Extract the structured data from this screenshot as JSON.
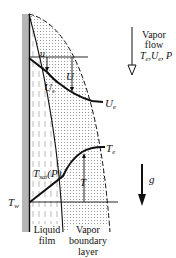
{
  "diagram": {
    "colors": {
      "wall": "#b5b5b5",
      "ink": "#111111",
      "stipple": "#9a9a9a"
    },
    "labels": {
      "u": "u",
      "U": "U",
      "Us": "U",
      "Us_sub": "s",
      "Ue": "U",
      "Ue_sub": "e",
      "Te": "T",
      "Te_sub": "e",
      "Tsat": "T",
      "Tsat_sub": "sat",
      "Tsat_arg": "(P)",
      "T": "T",
      "Tw": "T",
      "Tw_sub": "w",
      "g": "g"
    },
    "vapor_flow": {
      "line1": "Vapor",
      "line2": "flow",
      "params": "T",
      "params_sub1": "e",
      "params_mid": ",U",
      "params_sub2": "e",
      "params_end": ", P"
    },
    "regions": {
      "liquid_film_line1": "Liquid",
      "liquid_film_line2": "film",
      "vapor_bl_line1": "Vapor",
      "vapor_bl_line2": "boundary",
      "vapor_bl_line3": "layer"
    },
    "icons": {
      "vapor_flow_arrow": "down-hollow-arrow-icon",
      "gravity_arrow": "down-solid-arrow-icon"
    }
  }
}
